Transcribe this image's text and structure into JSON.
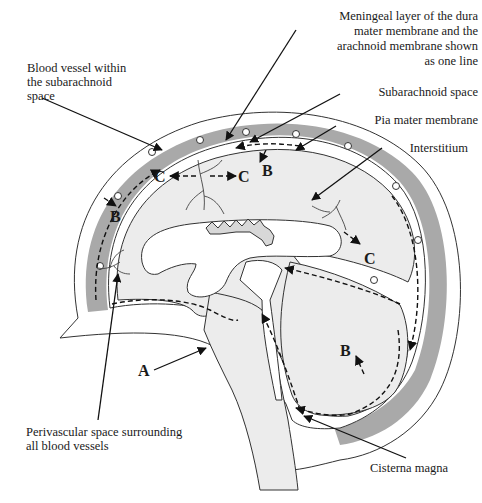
{
  "diagram": {
    "labels": {
      "meningeal_layer": [
        "Meningeal layer of the dura",
        "mater membrane and the",
        "arachnoid membrane shown",
        "as one line"
      ],
      "blood_vessel": [
        "Blood vessel within",
        "the subarachnoid",
        "space"
      ],
      "subarachnoid_space": "Subarachnoid space",
      "pia_mater": "Pia mater membrane",
      "interstitium": "Interstitium",
      "perivascular_space": [
        "Perivascular space surrounding",
        "all blood vessels"
      ],
      "cisterna_magna": "Cisterna magna"
    },
    "flow_markers": {
      "A": "A",
      "B": "B",
      "C": "C"
    },
    "colors": {
      "dura": "#a9a9a9",
      "brain": "#ececec",
      "ink": "#1a1a1a"
    }
  }
}
